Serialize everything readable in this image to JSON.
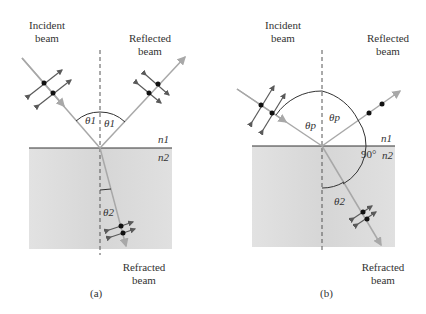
{
  "panels": [
    {
      "id": "a",
      "caption": "(a)",
      "labels": {
        "incident": [
          "Incident",
          "beam"
        ],
        "reflected": [
          "Reflected",
          "beam"
        ],
        "refracted": [
          "Refracted",
          "beam"
        ],
        "theta_incident": "θ1",
        "theta_reflected": "θ1",
        "theta_refracted": "θ2",
        "n1": "n1",
        "n2": "n2"
      }
    },
    {
      "id": "b",
      "caption": "(b)",
      "labels": {
        "incident": [
          "Incident",
          "beam"
        ],
        "reflected": [
          "Reflected",
          "beam"
        ],
        "refracted": [
          "Refracted",
          "beam"
        ],
        "theta_incident": "θp",
        "theta_reflected": "θp",
        "theta_refracted": "θ2",
        "right_angle": "90°",
        "n1": "n1",
        "n2": "n2"
      }
    }
  ],
  "colors": {
    "medium2": "#d9d9d9",
    "beam": "#a8a8a8",
    "normal": "#555555",
    "arrow": "#5a5a5a",
    "dot": "#111111"
  }
}
